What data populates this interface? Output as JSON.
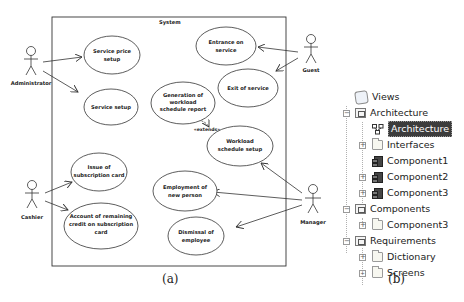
{
  "figure": {
    "panel_a": {
      "caption": "(a)",
      "system_label": "System",
      "actors": [
        {
          "id": "administrator",
          "label": "Administrator"
        },
        {
          "id": "guest",
          "label": "Guest"
        },
        {
          "id": "cashier",
          "label": "Cashier"
        },
        {
          "id": "manager",
          "label": "Manager"
        }
      ],
      "use_cases": [
        {
          "id": "service-price-setup",
          "lines": [
            "Service price",
            "setup"
          ]
        },
        {
          "id": "service-setup",
          "lines": [
            "Service setup"
          ]
        },
        {
          "id": "entrance-on-service",
          "lines": [
            "Entrance on",
            "service"
          ]
        },
        {
          "id": "exit-of-service",
          "lines": [
            "Exit of service"
          ]
        },
        {
          "id": "generation-of-workload-schedule-report",
          "lines": [
            "Generation of",
            "workload",
            "schedule report"
          ]
        },
        {
          "id": "workload-schedule-setup",
          "lines": [
            "Workload",
            "schedule setup"
          ]
        },
        {
          "id": "issue-of-subscription-card",
          "lines": [
            "Issue of",
            "subscription card"
          ]
        },
        {
          "id": "account-of-remaining-credit",
          "lines": [
            "Account of remaining",
            "credit on subscription",
            "card"
          ]
        },
        {
          "id": "employment-of-new-person",
          "lines": [
            "Employment of",
            "new person"
          ]
        },
        {
          "id": "dismissal-of-employee",
          "lines": [
            "Dismissal of",
            "employee"
          ]
        }
      ],
      "relations": [
        {
          "from": "administrator",
          "to": "service-price-setup",
          "type": "association"
        },
        {
          "from": "administrator",
          "to": "service-setup",
          "type": "association"
        },
        {
          "from": "guest",
          "to": "entrance-on-service",
          "type": "association"
        },
        {
          "from": "guest",
          "to": "exit-of-service",
          "type": "association"
        },
        {
          "from": "cashier",
          "to": "issue-of-subscription-card",
          "type": "association"
        },
        {
          "from": "cashier",
          "to": "account-of-remaining-credit",
          "type": "association"
        },
        {
          "from": "manager",
          "to": "workload-schedule-setup",
          "type": "association"
        },
        {
          "from": "manager",
          "to": "employment-of-new-person",
          "type": "association"
        },
        {
          "from": "manager",
          "to": "dismissal-of-employee",
          "type": "association"
        },
        {
          "from": "generation-of-workload-schedule-report",
          "to": "workload-schedule-setup",
          "type": "extends",
          "label": "«extends»"
        }
      ]
    },
    "panel_b": {
      "caption": "(b)",
      "tree": {
        "root": "Views",
        "items": [
          {
            "label": "Architecture",
            "level": 1,
            "icon": "view-icon",
            "expander": "minus"
          },
          {
            "label": "Architecture",
            "level": 2,
            "icon": "diagram-icon",
            "expander": "none",
            "selected": true
          },
          {
            "label": "Interfaces",
            "level": 2,
            "icon": "folder-icon",
            "expander": "plus"
          },
          {
            "label": "Component1",
            "level": 2,
            "icon": "component-icon",
            "expander": "none"
          },
          {
            "label": "Component2",
            "level": 2,
            "icon": "component-icon",
            "expander": "plus"
          },
          {
            "label": "Component3",
            "level": 2,
            "icon": "component-icon",
            "expander": "plus"
          },
          {
            "label": "Components",
            "level": 1,
            "icon": "view-icon",
            "expander": "minus"
          },
          {
            "label": "Component3",
            "level": 2,
            "icon": "folder-icon",
            "expander": "plus"
          },
          {
            "label": "Requirements",
            "level": 1,
            "icon": "view-icon",
            "expander": "minus"
          },
          {
            "label": "Dictionary",
            "level": 2,
            "icon": "folder-icon",
            "expander": "plus"
          },
          {
            "label": "Screens",
            "level": 2,
            "icon": "folder-icon",
            "expander": "plus"
          },
          {
            "label": "Use cases",
            "level": 2,
            "icon": "folder-icon",
            "expander": "plus"
          }
        ]
      }
    }
  }
}
